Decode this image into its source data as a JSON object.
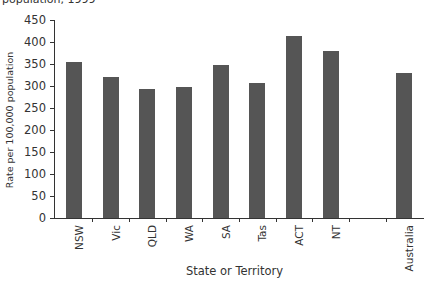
{
  "chart_data": {
    "type": "bar",
    "title": "population, 1999",
    "xlabel": "State or Territory",
    "ylabel": "Rate per 100,000 population",
    "ylim": [
      0,
      450
    ],
    "yticks": [
      0,
      50,
      100,
      150,
      200,
      250,
      300,
      350,
      400,
      450
    ],
    "grid": false,
    "categories": [
      "NSW",
      "Vic",
      "QLD",
      "WA",
      "SA",
      "Tas",
      "ACT",
      "NT",
      "",
      "Australia"
    ],
    "values": [
      355,
      320,
      293,
      297,
      347,
      307,
      414,
      380,
      null,
      330
    ],
    "bar_color": "#555555"
  }
}
